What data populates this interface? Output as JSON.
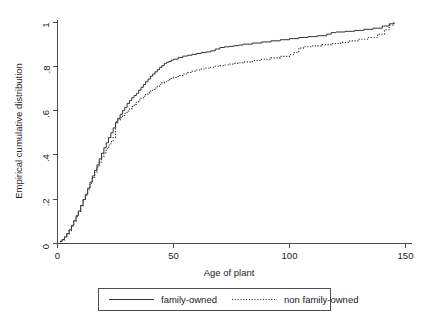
{
  "chart_data": {
    "type": "line",
    "title": "",
    "subtitle": "",
    "xlabel": "Age of plant",
    "ylabel": "Empirical cumulative distribution",
    "xlim": [
      0,
      150
    ],
    "ylim": [
      0,
      1
    ],
    "xticks": [
      0,
      50,
      100,
      150
    ],
    "xticklabels": [
      "0",
      "50",
      "100",
      "150"
    ],
    "yticks": [
      0,
      0.2,
      0.4,
      0.6,
      0.8,
      1
    ],
    "yticklabels": [
      "0",
      ".2",
      ".4",
      ".6",
      ".8",
      "1"
    ],
    "grid": false,
    "legend_position": "below-axis",
    "series": [
      {
        "name": "family-owned",
        "style": "solid",
        "color": "#333333",
        "points": [
          [
            1,
            0.01
          ],
          [
            2,
            0.018
          ],
          [
            3,
            0.03
          ],
          [
            4,
            0.045
          ],
          [
            5,
            0.062
          ],
          [
            6,
            0.082
          ],
          [
            7,
            0.103
          ],
          [
            8,
            0.125
          ],
          [
            9,
            0.147
          ],
          [
            10,
            0.172
          ],
          [
            11,
            0.198
          ],
          [
            12,
            0.222
          ],
          [
            13,
            0.25
          ],
          [
            14,
            0.277
          ],
          [
            15,
            0.305
          ],
          [
            16,
            0.33
          ],
          [
            17,
            0.355
          ],
          [
            18,
            0.382
          ],
          [
            19,
            0.408
          ],
          [
            20,
            0.432
          ],
          [
            21,
            0.455
          ],
          [
            22,
            0.478
          ],
          [
            23,
            0.5
          ],
          [
            24,
            0.522
          ],
          [
            25,
            0.545
          ],
          [
            26,
            0.565
          ],
          [
            27,
            0.583
          ],
          [
            28,
            0.6
          ],
          [
            29,
            0.615
          ],
          [
            30,
            0.632
          ],
          [
            31,
            0.645
          ],
          [
            32,
            0.658
          ],
          [
            33,
            0.668
          ],
          [
            34,
            0.678
          ],
          [
            35,
            0.692
          ],
          [
            36,
            0.705
          ],
          [
            37,
            0.718
          ],
          [
            38,
            0.73
          ],
          [
            39,
            0.742
          ],
          [
            40,
            0.755
          ],
          [
            41,
            0.765
          ],
          [
            42,
            0.775
          ],
          [
            43,
            0.785
          ],
          [
            44,
            0.795
          ],
          [
            45,
            0.803
          ],
          [
            46,
            0.812
          ],
          [
            47,
            0.818
          ],
          [
            48,
            0.822
          ],
          [
            49,
            0.828
          ],
          [
            50,
            0.832
          ],
          [
            52,
            0.84
          ],
          [
            54,
            0.846
          ],
          [
            56,
            0.85
          ],
          [
            58,
            0.854
          ],
          [
            60,
            0.858
          ],
          [
            62,
            0.862
          ],
          [
            64,
            0.865
          ],
          [
            66,
            0.87
          ],
          [
            68,
            0.878
          ],
          [
            70,
            0.885
          ],
          [
            72,
            0.888
          ],
          [
            74,
            0.89
          ],
          [
            76,
            0.893
          ],
          [
            78,
            0.896
          ],
          [
            80,
            0.9
          ],
          [
            84,
            0.905
          ],
          [
            88,
            0.91
          ],
          [
            92,
            0.915
          ],
          [
            96,
            0.92
          ],
          [
            100,
            0.925
          ],
          [
            104,
            0.93
          ],
          [
            108,
            0.934
          ],
          [
            112,
            0.938
          ],
          [
            116,
            0.945
          ],
          [
            118,
            0.952
          ],
          [
            120,
            0.955
          ],
          [
            124,
            0.958
          ],
          [
            128,
            0.962
          ],
          [
            132,
            0.967
          ],
          [
            136,
            0.972
          ],
          [
            140,
            0.982
          ],
          [
            143,
            0.992
          ],
          [
            145,
            1.0
          ]
        ]
      },
      {
        "name": "non family-owned",
        "style": "dotted",
        "color": "#333333",
        "points": [
          [
            1,
            0.008
          ],
          [
            2,
            0.016
          ],
          [
            3,
            0.028
          ],
          [
            4,
            0.042
          ],
          [
            5,
            0.058
          ],
          [
            6,
            0.078
          ],
          [
            7,
            0.1
          ],
          [
            8,
            0.122
          ],
          [
            9,
            0.145
          ],
          [
            10,
            0.17
          ],
          [
            11,
            0.195
          ],
          [
            12,
            0.218
          ],
          [
            13,
            0.245
          ],
          [
            14,
            0.272
          ],
          [
            15,
            0.298
          ],
          [
            16,
            0.322
          ],
          [
            17,
            0.345
          ],
          [
            18,
            0.368
          ],
          [
            19,
            0.39
          ],
          [
            20,
            0.41
          ],
          [
            21,
            0.428
          ],
          [
            22,
            0.445
          ],
          [
            23,
            0.46
          ],
          [
            24,
            0.478
          ],
          [
            25,
            0.55
          ],
          [
            26,
            0.558
          ],
          [
            27,
            0.568
          ],
          [
            28,
            0.578
          ],
          [
            29,
            0.588
          ],
          [
            30,
            0.598
          ],
          [
            31,
            0.608
          ],
          [
            32,
            0.618
          ],
          [
            33,
            0.628
          ],
          [
            34,
            0.638
          ],
          [
            35,
            0.648
          ],
          [
            36,
            0.657
          ],
          [
            37,
            0.665
          ],
          [
            38,
            0.673
          ],
          [
            39,
            0.68
          ],
          [
            40,
            0.688
          ],
          [
            41,
            0.695
          ],
          [
            42,
            0.702
          ],
          [
            43,
            0.71
          ],
          [
            44,
            0.718
          ],
          [
            45,
            0.725
          ],
          [
            46,
            0.73
          ],
          [
            47,
            0.735
          ],
          [
            48,
            0.74
          ],
          [
            49,
            0.745
          ],
          [
            50,
            0.75
          ],
          [
            52,
            0.758
          ],
          [
            54,
            0.765
          ],
          [
            56,
            0.772
          ],
          [
            58,
            0.778
          ],
          [
            60,
            0.783
          ],
          [
            62,
            0.788
          ],
          [
            64,
            0.792
          ],
          [
            66,
            0.796
          ],
          [
            68,
            0.8
          ],
          [
            70,
            0.803
          ],
          [
            72,
            0.806
          ],
          [
            74,
            0.81
          ],
          [
            76,
            0.813
          ],
          [
            78,
            0.816
          ],
          [
            80,
            0.82
          ],
          [
            84,
            0.826
          ],
          [
            88,
            0.832
          ],
          [
            92,
            0.838
          ],
          [
            96,
            0.845
          ],
          [
            100,
            0.852
          ],
          [
            102,
            0.862
          ],
          [
            104,
            0.882
          ],
          [
            106,
            0.888
          ],
          [
            110,
            0.892
          ],
          [
            114,
            0.898
          ],
          [
            118,
            0.903
          ],
          [
            122,
            0.908
          ],
          [
            126,
            0.915
          ],
          [
            130,
            0.922
          ],
          [
            134,
            0.93
          ],
          [
            138,
            0.945
          ],
          [
            141,
            0.965
          ],
          [
            143,
            0.985
          ],
          [
            145,
            1.0
          ]
        ]
      }
    ],
    "legend_entries": [
      {
        "label": "family-owned",
        "style": "solid"
      },
      {
        "label": "non family-owned",
        "style": "dotted"
      }
    ]
  }
}
